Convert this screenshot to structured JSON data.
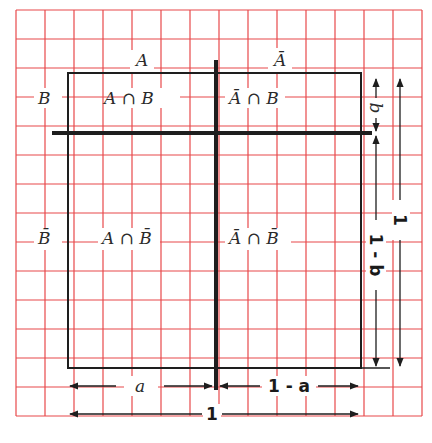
{
  "diagram": {
    "type": "probability-area-diagram",
    "grid": {
      "color": "#e8484a",
      "cols": 14,
      "rows": 14
    },
    "column_headers": [
      "A",
      "Ā"
    ],
    "row_headers": [
      "B",
      "B̄"
    ],
    "cells": {
      "top_left": "A ∩ B",
      "top_right": "Ā ∩ B",
      "bottom_left": "A ∩ B̄",
      "bottom_right": "Ā ∩ B̄"
    },
    "dimensions": {
      "horizontal_left": "a",
      "horizontal_right": "1 - a",
      "horizontal_total": "1",
      "vertical_top": "b",
      "vertical_bottom": "1 - b",
      "vertical_total": "1"
    },
    "colors": {
      "grid": "#e8484a",
      "ink": "#1e1e1e"
    }
  }
}
